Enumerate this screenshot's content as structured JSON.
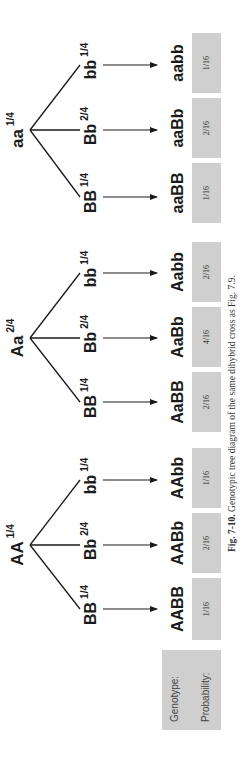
{
  "figure": {
    "caption_label": "Fig. 7-10.",
    "caption_text": "Genotypic tree diagram of the same dihybrid cross as Fig. 7.9.",
    "legend": {
      "row1": "Genotype:",
      "row2": "Probability:"
    },
    "colors": {
      "box_fill": "#cfcfcf",
      "line": "#1a1a1a",
      "text": "#1a1a1a"
    }
  },
  "groups": [
    {
      "parent": "AA",
      "parent_prob": "1/4",
      "children": [
        {
          "label": "BB",
          "prob": "1/4",
          "genotype": "AABB",
          "probability": "1/16"
        },
        {
          "label": "Bb",
          "prob": "2/4",
          "genotype": "AABb",
          "probability": "2/16"
        },
        {
          "label": "bb",
          "prob": "1/4",
          "genotype": "AAbb",
          "probability": "1/16"
        }
      ]
    },
    {
      "parent": "Aa",
      "parent_prob": "2/4",
      "children": [
        {
          "label": "BB",
          "prob": "1/4",
          "genotype": "AaBB",
          "probability": "2/16"
        },
        {
          "label": "Bb",
          "prob": "2/4",
          "genotype": "AaBb",
          "probability": "4/16"
        },
        {
          "label": "bb",
          "prob": "1/4",
          "genotype": "Aabb",
          "probability": "2/16"
        }
      ]
    },
    {
      "parent": "aa",
      "parent_prob": "1/4",
      "children": [
        {
          "label": "BB",
          "prob": "1/4",
          "genotype": "aaBB",
          "probability": "1/16"
        },
        {
          "label": "Bb",
          "prob": "2/4",
          "genotype": "aaBb",
          "probability": "2/16"
        },
        {
          "label": "bb",
          "prob": "1/4",
          "genotype": "aabb",
          "probability": "1/16"
        }
      ]
    }
  ]
}
